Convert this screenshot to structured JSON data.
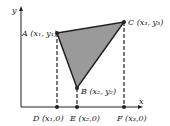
{
  "axes": {
    "x_label": "x",
    "y_label": "y"
  },
  "points": {
    "A": {
      "label": "A (x₁, y₁)"
    },
    "B": {
      "label": "B (x₂, y₂)"
    },
    "C": {
      "label": "C (x₃, y₃)"
    },
    "D": {
      "label": "D (x₁,0)"
    },
    "E": {
      "label": "E (x₂,0)"
    },
    "F": {
      "label": "F (x₃,0)"
    }
  },
  "colors": {
    "triangle_fill": "#9a9a9a",
    "stroke": "#222222"
  }
}
